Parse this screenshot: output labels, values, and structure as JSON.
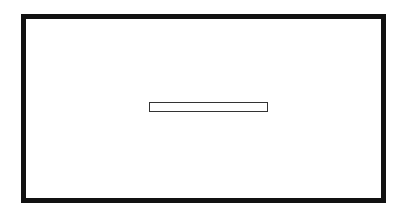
{
  "window": {
    "border_color": "#111111",
    "background": "#ffffff"
  },
  "input": {
    "value": "",
    "placeholder": ""
  }
}
